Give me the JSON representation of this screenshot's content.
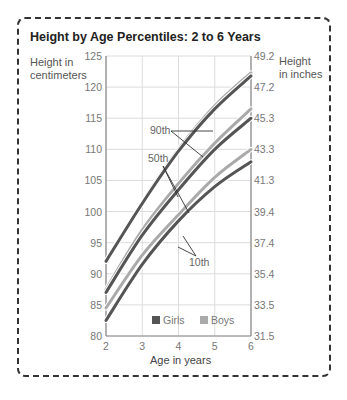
{
  "chart_data": {
    "type": "line",
    "title": "Height by Age Percentiles: 2 to 6 Years",
    "xlabel": "Age in years",
    "ylabel": "Height in centimeters",
    "ylabel_right": "Height in inches",
    "x": [
      2,
      3,
      4,
      5,
      6
    ],
    "xlim": [
      2,
      6
    ],
    "ylim": [
      80,
      125
    ],
    "x_ticks": [
      "2",
      "3",
      "4",
      "5",
      "6"
    ],
    "y_ticks_left": [
      "80",
      "85",
      "90",
      "95",
      "100",
      "105",
      "110",
      "115",
      "120",
      "125"
    ],
    "y_ticks_right": [
      "31.5",
      "33.5",
      "35.4",
      "37.4",
      "39.4",
      "41.3",
      "43.3",
      "45.3",
      "47.2",
      "49.2"
    ],
    "grid": true,
    "legend": [
      "Girls",
      "Boys"
    ],
    "legend_position": "bottom inside",
    "colors": {
      "Girls": "#555555",
      "Boys": "#aaaaaa"
    },
    "series": [
      {
        "name": "Boys 90th",
        "group": "Boys",
        "percentile": "90th",
        "values": [
          92,
          101.5,
          110,
          117,
          122.3
        ]
      },
      {
        "name": "Girls 90th",
        "group": "Girls",
        "percentile": "90th",
        "values": [
          92,
          101.3,
          109.7,
          116.5,
          121.8
        ]
      },
      {
        "name": "Boys 50th",
        "group": "Boys",
        "percentile": "50th",
        "values": [
          87.5,
          97,
          104.5,
          111,
          116.5
        ]
      },
      {
        "name": "Girls 50th",
        "group": "Girls",
        "percentile": "50th",
        "values": [
          87,
          96.2,
          103.5,
          110,
          115
        ]
      },
      {
        "name": "Boys 10th",
        "group": "Boys",
        "percentile": "10th",
        "values": [
          84.5,
          93,
          99.5,
          105.5,
          110
        ]
      },
      {
        "name": "Girls 10th",
        "group": "Girls",
        "percentile": "10th",
        "values": [
          82.5,
          91.5,
          98.5,
          104,
          108
        ]
      }
    ],
    "annotations": [
      "90th",
      "50th",
      "10th"
    ]
  },
  "labels": {
    "title": "Height by Age Percentiles: 2 to 6 Years",
    "ylabel_left_1": "Height in",
    "ylabel_left_2": "centimeters",
    "ylabel_right_1": "Height",
    "ylabel_right_2": "in inches",
    "xlabel": "Age in years"
  }
}
